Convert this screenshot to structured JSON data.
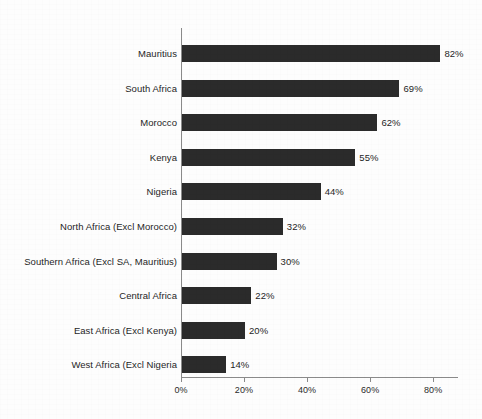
{
  "chart_data": {
    "type": "bar",
    "orientation": "horizontal",
    "title": "",
    "subtitle": "",
    "xlabel": "",
    "ylabel": "",
    "xlim": [
      0,
      88
    ],
    "grid": false,
    "legend": false,
    "value_suffix": "%",
    "categories": [
      "Mauritius",
      "South Africa",
      "Morocco",
      "Kenya",
      "Nigeria",
      "North Africa (Excl Morocco)",
      "Southern Africa (Excl SA, Mauritius)",
      "Central Africa",
      "East Africa (Excl Kenya)",
      "West Africa (Excl Nigeria"
    ],
    "values": [
      82,
      69,
      62,
      55,
      44,
      32,
      30,
      22,
      20,
      14
    ],
    "value_labels": [
      "82%",
      "69%",
      "62%",
      "55%",
      "44%",
      "32%",
      "30%",
      "22%",
      "20%",
      "14%"
    ],
    "xticks": [
      0,
      20,
      40,
      60,
      80
    ],
    "xtick_labels": [
      "0%",
      "20%",
      "40%",
      "60%",
      "80%"
    ],
    "colors": {
      "bar": "#2b2b2b",
      "axis": "#8a8a8a",
      "text": "#1f1f1f",
      "background": "#fdfdfd"
    }
  }
}
